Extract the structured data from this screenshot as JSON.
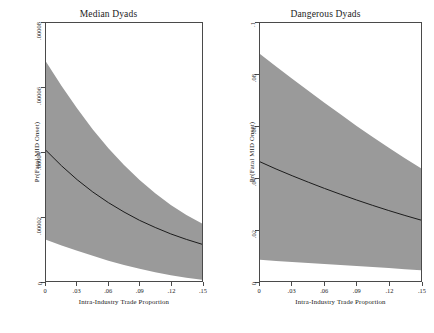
{
  "figure": {
    "background_color": "#ffffff",
    "band_color": "#9a9a9a",
    "line_color": "#1a1a1a",
    "axis_color": "#4a4a4a"
  },
  "chart_data": [
    {
      "type": "line",
      "title": "Median Dyads",
      "xlabel": "Intra-Industry Trade Proportion",
      "ylabel": "Pr(Fatal MID Onset)",
      "xlim": [
        0,
        0.15
      ],
      "ylim": [
        0,
        8e-05
      ],
      "grid": false,
      "legend": "none",
      "xticks": [
        0,
        0.03,
        0.06,
        0.09,
        0.12,
        0.15
      ],
      "xticklabels": [
        "0",
        ".03",
        ".06",
        ".09",
        ".12",
        ".15"
      ],
      "yticks": [
        0,
        2e-05,
        4e-05,
        6e-05,
        8e-05
      ],
      "yticklabels": [
        "0",
        ".00002",
        ".00004",
        ".00006",
        ".00008"
      ],
      "x": [
        0,
        0.015,
        0.03,
        0.045,
        0.06,
        0.075,
        0.09,
        0.105,
        0.12,
        0.135,
        0.15
      ],
      "series": [
        {
          "name": "Predicted probability",
          "values": [
            4.05e-05,
            3.57e-05,
            3.14e-05,
            2.76e-05,
            2.43e-05,
            2.14e-05,
            1.88e-05,
            1.66e-05,
            1.46e-05,
            1.29e-05,
            1.14e-05
          ]
        }
      ],
      "confidence_band": {
        "name": "95% confidence interval",
        "upper": [
          6.8e-05,
          6.05e-05,
          5.35e-05,
          4.7e-05,
          4.12e-05,
          3.6e-05,
          3.13e-05,
          2.72e-05,
          2.36e-05,
          2.05e-05,
          1.78e-05
        ],
        "lower": [
          1.28e-05,
          1.1e-05,
          9.4e-06,
          7.8e-06,
          6.3e-06,
          5e-06,
          3.8e-06,
          2.7e-06,
          1.8e-06,
          1e-06,
          4e-07
        ]
      }
    },
    {
      "type": "line",
      "title": "Dangerous Dyads",
      "xlabel": "Intra-Industry Trade Proportion",
      "ylabel": "Pr(Fatal MID Onset)",
      "xlim": [
        0,
        0.15
      ],
      "ylim": [
        0,
        0.1
      ],
      "grid": false,
      "legend": "none",
      "xticks": [
        0,
        0.03,
        0.06,
        0.09,
        0.12,
        0.15
      ],
      "xticklabels": [
        "0",
        ".03",
        ".06",
        ".09",
        ".12",
        ".15"
      ],
      "yticks": [
        0,
        0.02,
        0.04,
        0.06,
        0.08,
        0.1
      ],
      "yticklabels": [
        "0",
        ".02",
        ".04",
        ".06",
        ".08",
        ".1"
      ],
      "x": [
        0,
        0.015,
        0.03,
        0.045,
        0.06,
        0.075,
        0.09,
        0.105,
        0.12,
        0.135,
        0.15
      ],
      "series": [
        {
          "name": "Predicted probability",
          "values": [
            0.0462,
            0.0434,
            0.0408,
            0.0383,
            0.0359,
            0.0336,
            0.0314,
            0.0293,
            0.0273,
            0.0254,
            0.0236
          ]
        }
      ],
      "confidence_band": {
        "name": "95% confidence interval",
        "upper": [
          0.088,
          0.0831,
          0.0784,
          0.0737,
          0.0691,
          0.0646,
          0.0601,
          0.0558,
          0.0516,
          0.0476,
          0.0437
        ],
        "lower": [
          0.0082,
          0.0078,
          0.0074,
          0.007,
          0.0066,
          0.0062,
          0.0058,
          0.0054,
          0.005,
          0.0046,
          0.0042
        ]
      }
    }
  ]
}
